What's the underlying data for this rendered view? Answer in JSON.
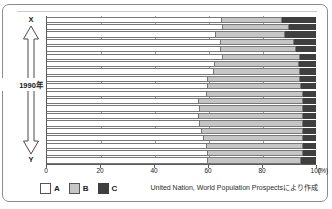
{
  "figure": {
    "axis_top_label": "X",
    "axis_bottom_label": "Y",
    "axis_middle_label": "1990年",
    "x_unit": "(%)",
    "source_note": "United Nation, World Population Prospectsにより作成"
  },
  "legend": {
    "items": [
      {
        "label": "A",
        "color": "#ffffff",
        "name": "legend-a"
      },
      {
        "label": "B",
        "color": "#c6c6c6",
        "name": "legend-b"
      },
      {
        "label": "C",
        "color": "#3f3f3f",
        "name": "legend-c"
      }
    ]
  },
  "chart_data": {
    "type": "bar",
    "orientation": "horizontal",
    "stacked": true,
    "stack_mode": "percent",
    "title": "",
    "subtitle": "",
    "xlabel": "(%)",
    "ylabel": "1990年",
    "xlim": [
      0,
      100
    ],
    "xticks": [
      0,
      20,
      40,
      60,
      80,
      100
    ],
    "xticklabels": [
      "0",
      "20",
      "40",
      "60",
      "80",
      "100"
    ],
    "grid": true,
    "grid_axis": "x",
    "legend_position": "bottom-left",
    "annotations": [
      "X",
      "Y",
      "1990年"
    ],
    "categories": [
      "1",
      "2",
      "3",
      "4",
      "5",
      "6",
      "7",
      "8",
      "9",
      "10",
      "11",
      "12",
      "13",
      "14",
      "15",
      "16",
      "17",
      "18",
      "19",
      "20"
    ],
    "series": [
      {
        "name": "A",
        "color": "#ffffff",
        "values": [
          65,
          65.5,
          63,
          64.5,
          64.5,
          65.5,
          62.5,
          62,
          60,
          60,
          59.5,
          56.5,
          57,
          56.5,
          57,
          57.5,
          58.5,
          59.5,
          60,
          60
        ]
      },
      {
        "name": "B",
        "color": "#c6c6c6",
        "values": [
          22.5,
          24.5,
          25.5,
          27.5,
          28,
          28.5,
          31,
          32,
          34,
          34.5,
          35.5,
          38.5,
          38,
          38.5,
          38,
          37.5,
          36.5,
          35.5,
          35,
          34.5
        ]
      },
      {
        "name": "C",
        "color": "#3f3f3f",
        "values": [
          12.5,
          10,
          11.5,
          8,
          7.5,
          6,
          6.5,
          6,
          6,
          5.5,
          5,
          5,
          5,
          5,
          5,
          5,
          5,
          5,
          5,
          5.5
        ]
      }
    ]
  }
}
